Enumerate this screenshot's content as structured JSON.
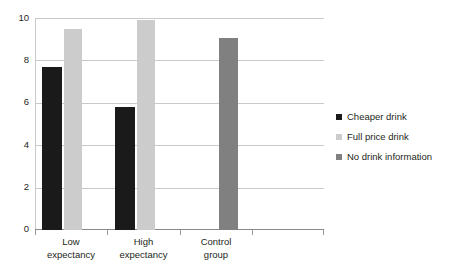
{
  "chart_data": {
    "type": "bar",
    "title": "",
    "subtitle": "",
    "xlabel": "",
    "ylabel": "",
    "ylim": [
      0,
      10
    ],
    "yticks": [
      0,
      2,
      4,
      6,
      8,
      10
    ],
    "ytick_labels": [
      "0",
      "2",
      "4",
      "6",
      "8",
      "10"
    ],
    "grid": true,
    "legend_position": "right",
    "categories": [
      "Low expectancy",
      "High expectancy",
      "Control group"
    ],
    "category_lines": [
      [
        "Low",
        "expectancy"
      ],
      [
        "High",
        "expectancy"
      ],
      [
        "Control",
        "group"
      ]
    ],
    "series": [
      {
        "name": "Cheaper drink",
        "color": "#1a1a1a",
        "values": [
          7.7,
          5.8,
          null
        ]
      },
      {
        "name": "Full price drink",
        "color": "#cccccc",
        "values": [
          9.5,
          9.9,
          null
        ]
      },
      {
        "name": "No drink information",
        "color": "#808080",
        "values": [
          null,
          null,
          9.05
        ]
      }
    ],
    "legend": [
      {
        "label": "Cheaper drink",
        "color": "#1a1a1a",
        "swatch": "square-swatch"
      },
      {
        "label": "Full price drink",
        "color": "#cccccc",
        "swatch": "square-swatch"
      },
      {
        "label": "No drink information",
        "color": "#808080",
        "swatch": "square-swatch"
      }
    ]
  },
  "axis": {
    "y_tick_labels": [
      "10",
      "8",
      "6",
      "4",
      "2",
      "0"
    ],
    "gridline_color": "#c9c9c9",
    "baseline_color": "#8a8a8a"
  }
}
